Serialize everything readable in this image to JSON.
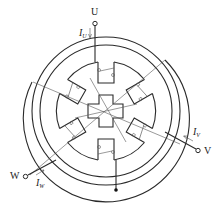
{
  "diagram": {
    "title": "",
    "type": "three-phase stepper motor stator/rotor winding diagram",
    "terminals": [
      {
        "id": "U",
        "label": "U",
        "current_label": "I",
        "current_sub": "U"
      },
      {
        "id": "V",
        "label": "V",
        "current_label": "I",
        "current_sub": "V"
      },
      {
        "id": "W",
        "label": "W",
        "current_label": "I",
        "current_sub": "W"
      }
    ],
    "stator_poles": 6,
    "rotor_teeth": 4,
    "colors": {
      "line": "#2a2a2a",
      "background": "#ffffff"
    }
  }
}
